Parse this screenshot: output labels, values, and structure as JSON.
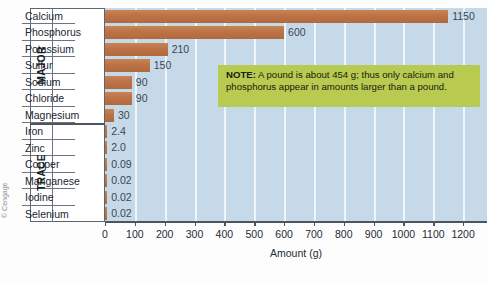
{
  "chart_data": {
    "type": "bar",
    "orientation": "horizontal",
    "title": "",
    "xlabel": "Amount (g)",
    "ylabel": "",
    "xlim": [
      0,
      1280
    ],
    "xticks": [
      0,
      100,
      200,
      300,
      400,
      500,
      600,
      700,
      800,
      900,
      1000,
      1100,
      1200
    ],
    "grid": true,
    "grid_axis": "x",
    "legend": "none",
    "groups": [
      {
        "name": "MAJOR",
        "categories": [
          "Calcium",
          "Phosphorus",
          "Potassium",
          "Sulfur",
          "Sodium",
          "Chloride",
          "Magnesium"
        ],
        "values": [
          1150,
          600,
          210,
          150,
          90,
          90,
          30
        ],
        "value_labels": [
          "1150",
          "600",
          "210",
          "150",
          "90",
          "90",
          "30"
        ]
      },
      {
        "name": "TRACE",
        "categories": [
          "Iron",
          "Zinc",
          "Copper",
          "Manganese",
          "Iodine",
          "Selenium"
        ],
        "values": [
          2.4,
          2.0,
          0.09,
          0.02,
          0.02,
          0.02
        ],
        "value_labels": [
          "2.4",
          "2.0",
          "0.09",
          "0.02",
          "0.02",
          "0.02"
        ]
      }
    ],
    "annotations": [
      {
        "name": "note",
        "bold_prefix": "NOTE:",
        "text": " A pound is about 454 g; thus only calcium and phosphorus appear in amounts larger than a pound."
      }
    ],
    "colors": {
      "bar": "#bd7245",
      "plot_background": "#c6d9e9",
      "gridline": "#f2f7fb",
      "note_background": "#b8ca50",
      "axis": "#4b5560",
      "text": "#242b33"
    }
  },
  "credit": "© Cengage"
}
